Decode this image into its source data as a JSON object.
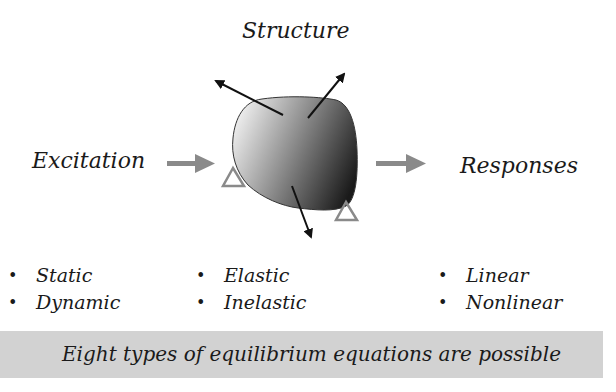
{
  "diagram": {
    "title": "Structure",
    "input_label": "Excitation",
    "output_label": "Responses",
    "colors": {
      "flow_arrow": "#8a8a8a",
      "support_triangle": "#8a8a8a",
      "force_arrow": "#111111",
      "blob_light": "#e6e6e6",
      "blob_dark": "#1e1e1e",
      "footer_band": "#d2d2d2"
    },
    "nodes": [
      {
        "id": "excitation",
        "label": "Excitation"
      },
      {
        "id": "structure",
        "label": "Structure",
        "shape": "shaded-blob",
        "supports": 2,
        "force_arrows": 3
      },
      {
        "id": "responses",
        "label": "Responses"
      }
    ],
    "edges": [
      {
        "from": "excitation",
        "to": "structure"
      },
      {
        "from": "structure",
        "to": "responses"
      }
    ]
  },
  "columns": {
    "excitation": {
      "items": [
        {
          "bullet": "•",
          "label": "Static"
        },
        {
          "bullet": "•",
          "label": "Dynamic"
        }
      ]
    },
    "structure": {
      "items": [
        {
          "bullet": "•",
          "label": "Elastic"
        },
        {
          "bullet": "•",
          "label": "Inelastic"
        }
      ]
    },
    "responses": {
      "items": [
        {
          "bullet": "•",
          "label": "Linear"
        },
        {
          "bullet": "•",
          "label": "Nonlinear"
        }
      ]
    }
  },
  "footer": {
    "text": "Eight types of equilibrium equations are possible"
  }
}
